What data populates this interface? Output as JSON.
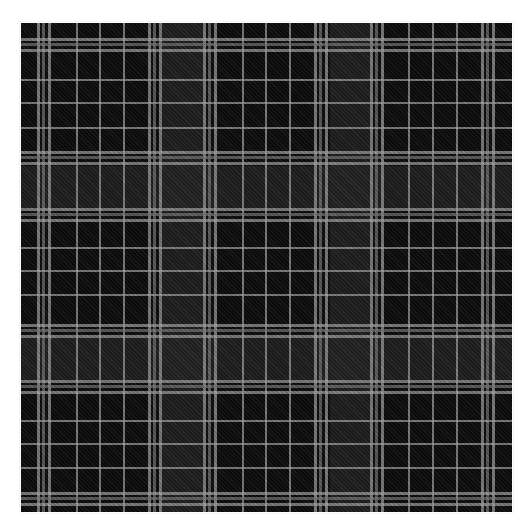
{
  "image": {
    "subject": "black and grey tartan plaid fabric swatch",
    "background_color": "#ffffff",
    "fabric_area": {
      "left": 21,
      "top": 23,
      "width": 491,
      "height": 489
    }
  },
  "colors": {
    "base": "#0d0d0d",
    "dark_band": "#262626",
    "line_light": "#a8a8a8",
    "line_mid": "#7a7a7a"
  },
  "vertical_dark_bands": [
    {
      "x": 141,
      "w": 41
    },
    {
      "x": 309,
      "w": 40
    }
  ],
  "horizontal_dark_bands": [
    {
      "y": 143,
      "w": 42
    },
    {
      "y": 315,
      "w": 42
    }
  ],
  "vertical_lines": [
    {
      "x": 16,
      "w": 3,
      "tone": "line_light"
    },
    {
      "x": 21,
      "w": 3,
      "tone": "line_mid"
    },
    {
      "x": 27,
      "w": 3,
      "tone": "line_light"
    },
    {
      "x": 55,
      "w": 2,
      "tone": "line_light"
    },
    {
      "x": 78,
      "w": 2,
      "tone": "line_light"
    },
    {
      "x": 102,
      "w": 2,
      "tone": "line_light"
    },
    {
      "x": 127,
      "w": 3,
      "tone": "line_light"
    },
    {
      "x": 132,
      "w": 3,
      "tone": "line_mid"
    },
    {
      "x": 138,
      "w": 3,
      "tone": "line_light"
    },
    {
      "x": 182,
      "w": 3,
      "tone": "line_light"
    },
    {
      "x": 187,
      "w": 3,
      "tone": "line_mid"
    },
    {
      "x": 193,
      "w": 3,
      "tone": "line_light"
    },
    {
      "x": 221,
      "w": 2,
      "tone": "line_light"
    },
    {
      "x": 244,
      "w": 2,
      "tone": "line_light"
    },
    {
      "x": 268,
      "w": 2,
      "tone": "line_light"
    },
    {
      "x": 293,
      "w": 3,
      "tone": "line_light"
    },
    {
      "x": 298,
      "w": 3,
      "tone": "line_mid"
    },
    {
      "x": 304,
      "w": 3,
      "tone": "line_light"
    },
    {
      "x": 349,
      "w": 3,
      "tone": "line_light"
    },
    {
      "x": 354,
      "w": 3,
      "tone": "line_mid"
    },
    {
      "x": 360,
      "w": 3,
      "tone": "line_light"
    },
    {
      "x": 387,
      "w": 2,
      "tone": "line_light"
    },
    {
      "x": 411,
      "w": 2,
      "tone": "line_light"
    },
    {
      "x": 435,
      "w": 2,
      "tone": "line_light"
    },
    {
      "x": 460,
      "w": 3,
      "tone": "line_light"
    },
    {
      "x": 465,
      "w": 3,
      "tone": "line_mid"
    },
    {
      "x": 471,
      "w": 3,
      "tone": "line_light"
    }
  ],
  "horizontal_lines": [
    {
      "y": 15,
      "w": 3,
      "tone": "line_light"
    },
    {
      "y": 20,
      "w": 3,
      "tone": "line_mid"
    },
    {
      "y": 26,
      "w": 3,
      "tone": "line_light"
    },
    {
      "y": 56,
      "w": 2,
      "tone": "line_light"
    },
    {
      "y": 79,
      "w": 2,
      "tone": "line_light"
    },
    {
      "y": 104,
      "w": 2,
      "tone": "line_light"
    },
    {
      "y": 128,
      "w": 3,
      "tone": "line_light"
    },
    {
      "y": 133,
      "w": 3,
      "tone": "line_mid"
    },
    {
      "y": 139,
      "w": 3,
      "tone": "line_light"
    },
    {
      "y": 185,
      "w": 3,
      "tone": "line_light"
    },
    {
      "y": 190,
      "w": 3,
      "tone": "line_mid"
    },
    {
      "y": 196,
      "w": 3,
      "tone": "line_light"
    },
    {
      "y": 224,
      "w": 2,
      "tone": "line_light"
    },
    {
      "y": 247,
      "w": 2,
      "tone": "line_light"
    },
    {
      "y": 271,
      "w": 2,
      "tone": "line_light"
    },
    {
      "y": 301,
      "w": 3,
      "tone": "line_light"
    },
    {
      "y": 306,
      "w": 3,
      "tone": "line_mid"
    },
    {
      "y": 312,
      "w": 3,
      "tone": "line_light"
    },
    {
      "y": 357,
      "w": 3,
      "tone": "line_light"
    },
    {
      "y": 362,
      "w": 3,
      "tone": "line_mid"
    },
    {
      "y": 368,
      "w": 3,
      "tone": "line_light"
    },
    {
      "y": 397,
      "w": 2,
      "tone": "line_light"
    },
    {
      "y": 420,
      "w": 2,
      "tone": "line_light"
    },
    {
      "y": 444,
      "w": 2,
      "tone": "line_light"
    },
    {
      "y": 469,
      "w": 3,
      "tone": "line_light"
    },
    {
      "y": 474,
      "w": 3,
      "tone": "line_mid"
    },
    {
      "y": 480,
      "w": 3,
      "tone": "line_light"
    }
  ]
}
